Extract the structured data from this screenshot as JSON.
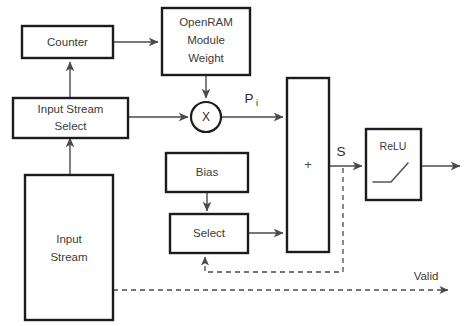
{
  "diagram": {
    "background_color": "#ffffff",
    "box_stroke_color": "#1c1c1c",
    "wire_color": "#4a4a4a",
    "text_color": "#3a3a3a",
    "blocks": {
      "counter": {
        "label": "Counter"
      },
      "openram": {
        "line1": "OpenRAM",
        "line2": "Module",
        "line3": "Weight"
      },
      "input_stream_select": {
        "line1": "Input Stream",
        "line2": "Select"
      },
      "input_stream": {
        "line1": "Input",
        "line2": "Stream"
      },
      "multiplier": {
        "label": "X"
      },
      "bias": {
        "label": "Bias"
      },
      "select": {
        "label": "Select"
      },
      "adder": {
        "label": "+"
      },
      "relu": {
        "label": "ReLU"
      }
    },
    "signals": {
      "product": {
        "base": "P",
        "subscript": "i"
      },
      "sum": {
        "label": "S"
      },
      "valid": {
        "label": "Valid"
      }
    }
  }
}
